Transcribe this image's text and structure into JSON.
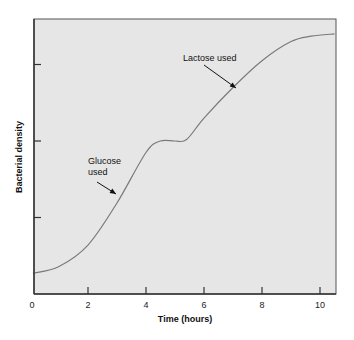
{
  "chart_data": {
    "type": "line",
    "title": "",
    "xlabel": "Time (hours)",
    "ylabel": "Bacterial density",
    "xlim": [
      0,
      10.5
    ],
    "ylim": [
      0,
      3.6
    ],
    "x_ticks": [
      0,
      2,
      4,
      6,
      8,
      10
    ],
    "x_tick_labels": [
      "0",
      "2",
      "4",
      "6",
      "8",
      "10"
    ],
    "y_ticks": [
      1,
      2,
      3
    ],
    "y_tick_labels": [
      "",
      "",
      ""
    ],
    "grid": false,
    "legend": null,
    "series": [
      {
        "name": "Bacterial density",
        "x": [
          0.1,
          1.0,
          2.0,
          3.0,
          4.0,
          4.5,
          5.0,
          5.4,
          6.0,
          7.0,
          8.0,
          9.0,
          9.7,
          10.5
        ],
        "y": [
          0.27,
          0.36,
          0.64,
          1.19,
          1.85,
          2.0,
          2.0,
          2.02,
          2.3,
          2.7,
          3.05,
          3.3,
          3.37,
          3.4
        ]
      }
    ],
    "annotations": [
      {
        "text_lines": [
          "Glucose",
          "used"
        ],
        "arrow_to_x": 3.0,
        "arrow_to_y": 1.2
      },
      {
        "text_lines": [
          "Lactose used"
        ],
        "arrow_to_x": 7.0,
        "arrow_to_y": 2.7
      }
    ],
    "colors": {
      "plot_background": "#e6e6e6",
      "line": "#7a7a7a",
      "axis": "#333333"
    }
  }
}
